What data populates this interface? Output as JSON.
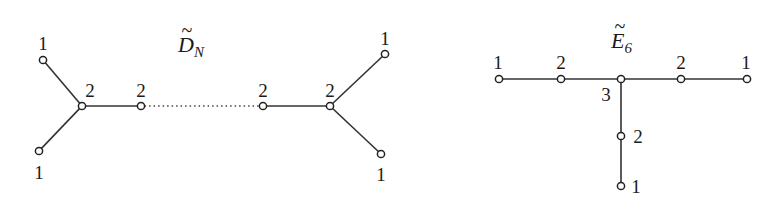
{
  "diagrams": [
    {
      "id": "D_N_tilde",
      "title": {
        "base": "D",
        "subscript": "N",
        "accent": "~"
      },
      "title_pos": [
        178,
        52
      ],
      "nodes": [
        {
          "x": 43,
          "y": 60,
          "label": "1",
          "lx": 43,
          "ly": 50
        },
        {
          "x": 39,
          "y": 151,
          "label": "1",
          "lx": 39,
          "ly": 179
        },
        {
          "x": 82,
          "y": 106,
          "label": "2",
          "lx": 90,
          "ly": 97
        },
        {
          "x": 141,
          "y": 106,
          "label": "2",
          "lx": 141,
          "ly": 97
        },
        {
          "x": 263,
          "y": 106,
          "label": "2",
          "lx": 263,
          "ly": 97
        },
        {
          "x": 330,
          "y": 106,
          "label": "2",
          "lx": 330,
          "ly": 97
        },
        {
          "x": 385,
          "y": 54,
          "label": "1",
          "lx": 385,
          "ly": 45
        },
        {
          "x": 381,
          "y": 154,
          "label": "1",
          "lx": 381,
          "ly": 181
        }
      ],
      "edges": [
        {
          "from": 0,
          "to": 2,
          "style": "solid"
        },
        {
          "from": 1,
          "to": 2,
          "style": "solid"
        },
        {
          "from": 2,
          "to": 3,
          "style": "solid"
        },
        {
          "from": 3,
          "to": 4,
          "style": "dotted"
        },
        {
          "from": 4,
          "to": 5,
          "style": "solid"
        },
        {
          "from": 5,
          "to": 6,
          "style": "solid"
        },
        {
          "from": 5,
          "to": 7,
          "style": "solid"
        }
      ]
    },
    {
      "id": "E_6_tilde",
      "title": {
        "base": "E",
        "subscript": "6",
        "accent": "~"
      },
      "title_pos": [
        611,
        48
      ],
      "nodes": [
        {
          "x": 499,
          "y": 79,
          "label": "1",
          "lx": 498,
          "ly": 69
        },
        {
          "x": 561,
          "y": 79,
          "label": "2",
          "lx": 561,
          "ly": 69
        },
        {
          "x": 621,
          "y": 79,
          "label": "3",
          "lx": 606,
          "ly": 101
        },
        {
          "x": 681,
          "y": 79,
          "label": "2",
          "lx": 681,
          "ly": 69
        },
        {
          "x": 747,
          "y": 79,
          "label": "1",
          "lx": 746,
          "ly": 69
        },
        {
          "x": 621,
          "y": 136,
          "label": "2",
          "lx": 638,
          "ly": 143
        },
        {
          "x": 621,
          "y": 186,
          "label": "1",
          "lx": 636,
          "ly": 193
        }
      ],
      "edges": [
        {
          "from": 0,
          "to": 1,
          "style": "solid"
        },
        {
          "from": 1,
          "to": 2,
          "style": "solid"
        },
        {
          "from": 2,
          "to": 3,
          "style": "solid"
        },
        {
          "from": 3,
          "to": 4,
          "style": "solid"
        },
        {
          "from": 2,
          "to": 5,
          "style": "solid"
        },
        {
          "from": 5,
          "to": 6,
          "style": "solid"
        }
      ]
    }
  ]
}
